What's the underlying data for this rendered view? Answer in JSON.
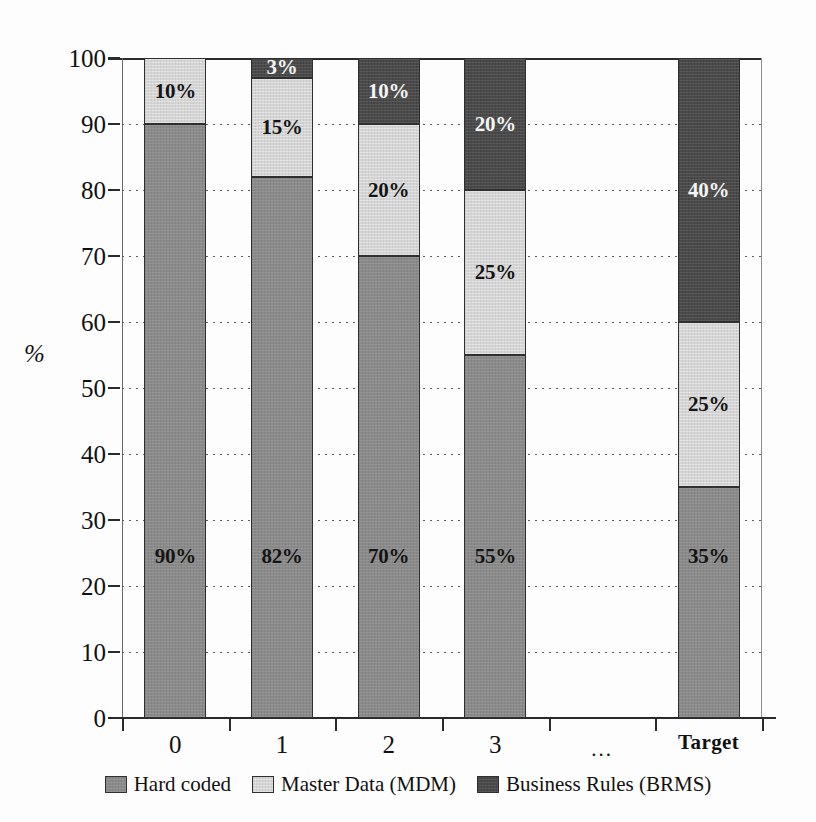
{
  "chart_data": {
    "type": "bar",
    "subtype": "stacked-bar-100-percent",
    "title": "",
    "xlabel": "",
    "ylabel": "%",
    "ylim": [
      0,
      100
    ],
    "yticks": [
      0,
      10,
      20,
      30,
      40,
      50,
      60,
      70,
      80,
      90,
      100
    ],
    "ytick_labels": [
      "0",
      "10",
      "20",
      "30",
      "40",
      "50",
      "60",
      "70",
      "80",
      "90",
      "100"
    ],
    "grid": true,
    "grid_style": "dotted-horizontal",
    "legend_position": "bottom-center",
    "categories": [
      "0",
      "1",
      "2",
      "3",
      "...",
      "Target"
    ],
    "series": [
      {
        "name": "Hard coded",
        "color": "#8a8a8a",
        "values": [
          90,
          82,
          70,
          55,
          null,
          35
        ],
        "labels": [
          "90%",
          "82%",
          "70%",
          "55%",
          "",
          "35%"
        ]
      },
      {
        "name": "Master Data (MDM)",
        "color": "#d5d5d5",
        "values": [
          10,
          15,
          20,
          25,
          null,
          25
        ],
        "labels": [
          "10%",
          "15%",
          "20%",
          "25%",
          "",
          "25%"
        ]
      },
      {
        "name": "Business Rules (BRMS)",
        "color": "#4a4a4a",
        "values": [
          0,
          3,
          10,
          20,
          null,
          40
        ],
        "labels": [
          "",
          "3%",
          "10%",
          "20%",
          "",
          "40%"
        ]
      }
    ]
  },
  "axes": {
    "y_title": "%",
    "y_ticks": [
      {
        "label": "100",
        "value": 100
      },
      {
        "label": "90",
        "value": 90
      },
      {
        "label": "80",
        "value": 80
      },
      {
        "label": "70",
        "value": 70
      },
      {
        "label": "60",
        "value": 60
      },
      {
        "label": "50",
        "value": 50
      },
      {
        "label": "40",
        "value": 40
      },
      {
        "label": "30",
        "value": 30
      },
      {
        "label": "20",
        "value": 20
      },
      {
        "label": "10",
        "value": 10
      },
      {
        "label": "0",
        "value": 0
      }
    ],
    "x_ticks": [
      {
        "label": "0",
        "bold": false
      },
      {
        "label": "1",
        "bold": false
      },
      {
        "label": "2",
        "bold": false
      },
      {
        "label": "3",
        "bold": false
      },
      {
        "label": "...",
        "bold": false
      },
      {
        "label": "Target",
        "bold": true
      }
    ]
  },
  "legend": {
    "items": [
      {
        "label": "Hard coded",
        "color": "#8a8a8a",
        "key": "hard"
      },
      {
        "label": "Master Data (MDM)",
        "color": "#d5d5d5",
        "key": "mdm"
      },
      {
        "label": "Business Rules (BRMS)",
        "color": "#4a4a4a",
        "key": "brms"
      }
    ]
  }
}
